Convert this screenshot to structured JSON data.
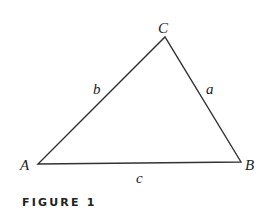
{
  "figure": {
    "caption": "FIGURE 1",
    "type": "triangle",
    "vertices": [
      {
        "label": "A",
        "x": 38,
        "y": 164
      },
      {
        "label": "B",
        "x": 241,
        "y": 162
      },
      {
        "label": "C",
        "x": 165,
        "y": 37
      }
    ],
    "sides": [
      {
        "label": "a",
        "between": "B-C"
      },
      {
        "label": "b",
        "between": "A-C"
      },
      {
        "label": "c",
        "between": "A-B"
      }
    ],
    "colors": {
      "stroke": "#333333",
      "text": "#222222"
    }
  }
}
